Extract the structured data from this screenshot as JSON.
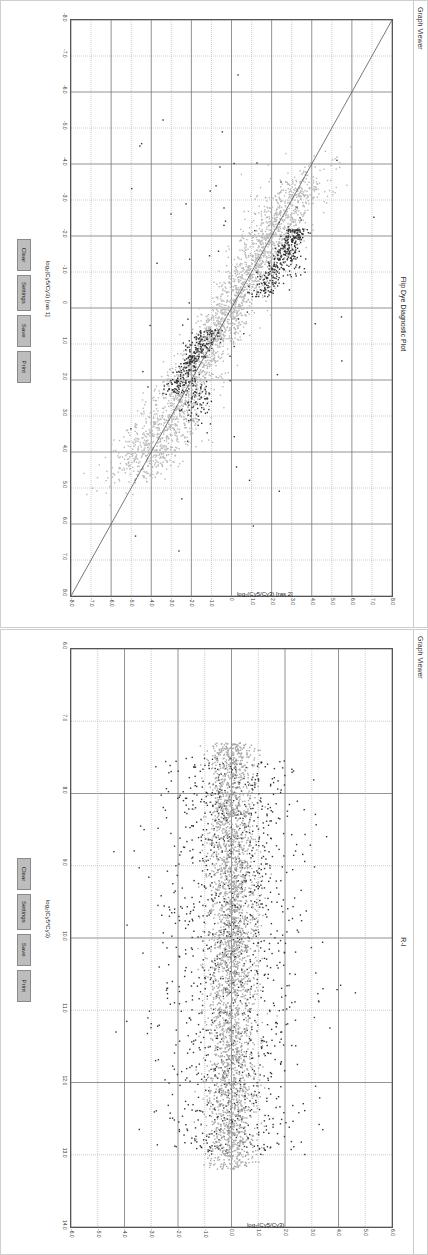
{
  "panels": [
    {
      "window_title": "Graph Viewer",
      "chart_title": "Flip Dye Diagnostic Plot",
      "buttons": [
        "Clear",
        "Settings",
        "Save",
        "Print"
      ],
      "xlabel": "log₂(Cy5/Cy3) [ras 1]",
      "ylabel": "log₂(Cy5/Cy3) [ras 2]"
    },
    {
      "window_title": "Graph Viewer",
      "chart_title": "R-I",
      "buttons": [
        "Clear",
        "Settings",
        "Save",
        "Print"
      ],
      "xlabel": "log₂(Cy5*Cy3)",
      "ylabel": "log₂(Cy5/Cy3)"
    }
  ],
  "chart_data": [
    {
      "type": "scatter",
      "title": "Flip Dye Diagnostic Plot",
      "xlabel": "log2(Cy5/Cy3) [ras 1]",
      "ylabel": "log2(Cy5/Cy3) [ras 2]",
      "xlim": [
        -8.0,
        8.0
      ],
      "ylim": [
        -8.0,
        8.0
      ],
      "x_ticks": [
        "-8.0",
        "-7.0",
        "-6.0",
        "-5.0",
        "-4.0",
        "-3.0",
        "-2.0",
        "-1.0",
        "0",
        "1.0",
        "2.0",
        "3.0",
        "4.0",
        "5.0",
        "6.0",
        "7.0",
        "8.0"
      ],
      "y_ticks": [
        "-8.0",
        "-7.0",
        "-6.0",
        "-5.0",
        "-4.0",
        "-3.0",
        "-2.0",
        "-1.0",
        "0",
        "1.0",
        "2.0",
        "3.0",
        "4.0",
        "5.0",
        "6.0",
        "7.0",
        "8.0"
      ],
      "grid": true,
      "reference_line": {
        "slope": -1,
        "intercept": 0,
        "from": [
          -8,
          8
        ],
        "to": [
          8,
          -8
        ]
      },
      "series": [
        {
          "name": "non-significant",
          "color": "#b8b8b8",
          "trend": "y = -x",
          "spread": 0.55,
          "x_range": [
            -3.5,
            4.5
          ],
          "count": 2600
        },
        {
          "name": "flagged cluster A",
          "color": "#333333",
          "center": [
            -1.2,
            2.2
          ],
          "x_range": [
            -2.2,
            -0.3
          ],
          "along": "y = -x + 1.2",
          "count": 260
        },
        {
          "name": "flagged cluster B",
          "color": "#333333",
          "center": [
            1.6,
            -1.2
          ],
          "x_range": [
            0.6,
            2.4
          ],
          "along": "y = -x - 0.4",
          "count": 260
        },
        {
          "name": "outliers",
          "color": "#333333",
          "count": 60
        }
      ]
    },
    {
      "type": "scatter",
      "title": "R-I",
      "xlabel": "log2(Cy5*Cy3)",
      "ylabel": "log2(Cy5/Cy3)",
      "xlim": [
        6.0,
        14.0
      ],
      "ylim": [
        -6.0,
        6.0
      ],
      "x_ticks": [
        "6.0",
        "7.0",
        "8.0",
        "9.0",
        "10.0",
        "11.0",
        "12.0",
        "13.0",
        "14.0"
      ],
      "y_ticks": [
        "-6.0",
        "-5.0",
        "-4.0",
        "-3.0",
        "-2.0",
        "-1.0",
        "0.0",
        "1.0",
        "2.0",
        "3.0",
        "4.0",
        "5.0",
        "6.0"
      ],
      "grid": true,
      "series": [
        {
          "name": "non-significant",
          "color": "#a8a8a8",
          "x_range": [
            7.3,
            13.2
          ],
          "y_spread": 0.45,
          "count": 3000
        },
        {
          "name": "significant",
          "color": "#333333",
          "x_range": [
            7.5,
            13.0
          ],
          "y_spread": 1.3,
          "count": 1400
        }
      ]
    }
  ]
}
